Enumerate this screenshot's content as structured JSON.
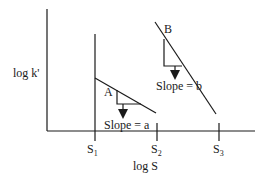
{
  "diagram": {
    "axes": {
      "y_label": "log k'",
      "x_label": "log S"
    },
    "ticks": [
      {
        "base": "S",
        "sub": "1"
      },
      {
        "base": "S",
        "sub": "2"
      },
      {
        "base": "S",
        "sub": "3"
      }
    ],
    "lines": [
      {
        "label": "A",
        "slope_label": "Slope = a"
      },
      {
        "label": "B",
        "slope_label": "Slope = b"
      }
    ],
    "colors": {
      "ink": "#1a1a1a",
      "background": "#ffffff"
    }
  }
}
